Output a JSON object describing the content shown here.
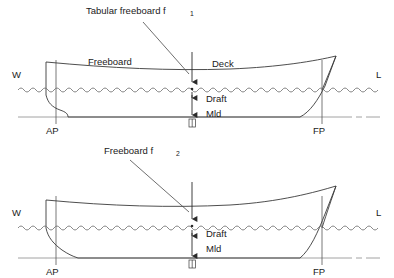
{
  "figure": {
    "type": "technical-diagram",
    "background_color": "#ffffff",
    "line_color": "#3a3a3a",
    "text_color": "#1a1a1a",
    "waterline_color": "#6a6a6a"
  },
  "diagrams": [
    {
      "id": "upper",
      "callout": {
        "text": "Tabular freeboard f",
        "subscript": "1"
      },
      "labels": {
        "freeboard": "Freeboard",
        "deck": "Deck",
        "draft": "Draft",
        "mld": "Mld",
        "waterline_left": "W",
        "waterline_right": "L",
        "aft_perpendicular": "AP",
        "forward_perpendicular": "FP",
        "midship_symbol": "midship-symbol"
      },
      "geometry": {
        "deck_y": 67,
        "waterline_y": 90,
        "baseline_y": 117,
        "ap_x": 56,
        "fp_x": 322,
        "midship_x": 192
      }
    },
    {
      "id": "lower",
      "callout": {
        "text": "Freeboard f",
        "subscript": "2"
      },
      "labels": {
        "draft": "Draft",
        "mld": "Mld",
        "waterline_left": "W",
        "waterline_right": "L",
        "aft_perpendicular": "AP",
        "forward_perpendicular": "FP",
        "midship_symbol": "midship-symbol"
      },
      "geometry": {
        "deck_y": 202,
        "waterline_y": 228,
        "baseline_y": 258,
        "ap_x": 56,
        "fp_x": 322,
        "midship_x": 192
      }
    }
  ]
}
